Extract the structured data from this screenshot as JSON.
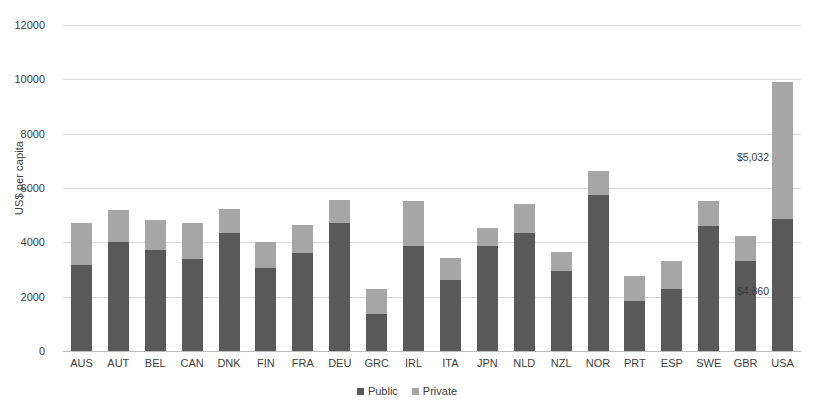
{
  "chart_data": {
    "type": "bar",
    "subtype": "stacked-bar",
    "title": "",
    "subtitle": "",
    "xlabel": "",
    "ylabel": "US$ per capita",
    "ylim": [
      0,
      12000
    ],
    "ytick_step": 2000,
    "yticks": [
      0,
      2000,
      4000,
      6000,
      8000,
      10000,
      12000
    ],
    "ytick_labels": [
      "0",
      "2000",
      "4000",
      "6000",
      "8000",
      "10000",
      "12000"
    ],
    "grid": true,
    "legend_position": "bottom-center",
    "categories": [
      "AUS",
      "AUT",
      "BEL",
      "CAN",
      "DNK",
      "FIN",
      "FRA",
      "DEU",
      "GRC",
      "IRL",
      "ITA",
      "JPN",
      "NLD",
      "NZL",
      "NOR",
      "PRT",
      "ESP",
      "SWE",
      "GBR",
      "USA"
    ],
    "series": [
      {
        "name": "Public",
        "color": "#595959",
        "values": [
          3150,
          4010,
          3720,
          3400,
          4340,
          3060,
          3620,
          4700,
          1380,
          3850,
          2600,
          3880,
          4340,
          2940,
          5730,
          1850,
          2280,
          4620,
          3320,
          4860
        ]
      },
      {
        "name": "Private",
        "color": "#a6a6a6",
        "values": [
          1550,
          1190,
          1100,
          1330,
          870,
          960,
          1020,
          860,
          900,
          1680,
          840,
          640,
          1070,
          690,
          910,
          930,
          1050,
          890,
          900,
          5032
        ]
      }
    ],
    "annotations": [
      {
        "category": "USA",
        "series": "Private",
        "text": "$5,032"
      },
      {
        "category": "USA",
        "series": "Public",
        "text": "$4,860"
      }
    ],
    "legend": [
      {
        "label": "Public",
        "color": "#595959"
      },
      {
        "label": "Private",
        "color": "#a6a6a6"
      }
    ]
  }
}
